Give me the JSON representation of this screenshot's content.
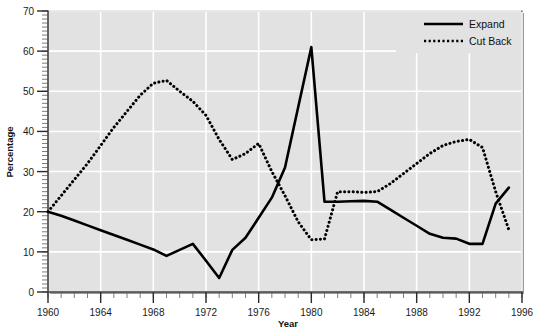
{
  "chart_data": {
    "type": "line",
    "title": "",
    "xlabel": "Year",
    "ylabel": "Percentage",
    "xlim": [
      1960,
      1996
    ],
    "ylim": [
      0,
      70
    ],
    "xticks": [
      1960,
      1964,
      1968,
      1972,
      1976,
      1980,
      1984,
      1988,
      1992,
      1996
    ],
    "xtick_labels": [
      "1960",
      "1964",
      "1968",
      "1972",
      "1976",
      "1980",
      "1984",
      "1988",
      "1992",
      "1996"
    ],
    "xminor_step": 1,
    "yticks": [
      0,
      10,
      20,
      30,
      40,
      50,
      60,
      70
    ],
    "ytick_labels": [
      "0",
      "10",
      "20",
      "30",
      "40",
      "50",
      "60",
      "70"
    ],
    "yminor_step": 1,
    "grid": true,
    "grid_color": "#ffffff",
    "plot_bgcolor": "#e2e2e2",
    "legend_position": "top-right",
    "series": [
      {
        "name": "Expand",
        "style": "solid",
        "color": "#000000",
        "x": [
          1960,
          1961,
          1962,
          1963,
          1964,
          1965,
          1966,
          1967,
          1968,
          1969,
          1970,
          1971,
          1972,
          1973,
          1974,
          1975,
          1976,
          1977,
          1978,
          1979,
          1980,
          1981,
          1982,
          1983,
          1984,
          1985,
          1986,
          1987,
          1988,
          1989,
          1990,
          1991,
          1992,
          1993,
          1994,
          1995
        ],
        "y": [
          20.0,
          19.0,
          17.8,
          16.6,
          15.4,
          14.2,
          13.0,
          11.8,
          10.6,
          9.0,
          10.5,
          12.0,
          7.8,
          3.5,
          10.5,
          13.5,
          18.5,
          23.5,
          31.0,
          46.0,
          61.0,
          22.5,
          22.5,
          22.6,
          22.7,
          22.5,
          20.5,
          18.5,
          16.5,
          14.5,
          13.5,
          13.3,
          12.0,
          12.0,
          22.0,
          26.0
        ]
      },
      {
        "name": "Cut Back",
        "style": "dotted",
        "color": "#000000",
        "x": [
          1960,
          1961,
          1962,
          1963,
          1964,
          1965,
          1966,
          1967,
          1968,
          1969,
          1970,
          1971,
          1972,
          1973,
          1974,
          1975,
          1976,
          1977,
          1978,
          1979,
          1980,
          1981,
          1982,
          1983,
          1984,
          1985,
          1986,
          1987,
          1988,
          1989,
          1990,
          1991,
          1992,
          1993,
          1994,
          1995
        ],
        "y": [
          20.0,
          24.0,
          28.0,
          32.0,
          36.5,
          41.0,
          45.0,
          49.0,
          52.0,
          52.7,
          50.0,
          47.5,
          44.0,
          38.0,
          33.0,
          34.5,
          37.0,
          30.0,
          24.0,
          17.5,
          13.0,
          13.2,
          25.0,
          25.0,
          24.8,
          25.0,
          27.0,
          29.5,
          32.0,
          34.5,
          36.5,
          37.5,
          38.0,
          36.0,
          25.0,
          15.5
        ]
      }
    ],
    "annotations": []
  },
  "legend": {
    "items": [
      {
        "label": "Expand",
        "style": "solid"
      },
      {
        "label": "Cut Back",
        "style": "dotted"
      }
    ]
  }
}
